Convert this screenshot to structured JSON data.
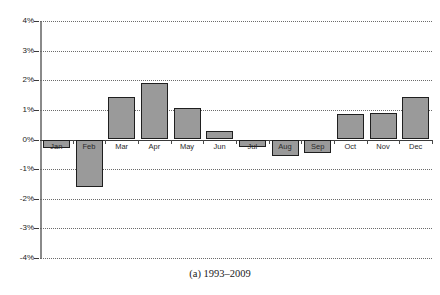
{
  "caption": "(a) 1993–2009",
  "chart_data": {
    "type": "bar",
    "title": "",
    "subtitle": "",
    "xlabel": "",
    "ylabel": "",
    "categories": [
      "Jan",
      "Feb",
      "Mar",
      "Apr",
      "May",
      "Jun",
      "Jul",
      "Aug",
      "Sep",
      "Oct",
      "Nov",
      "Dec"
    ],
    "values": [
      -0.28,
      -1.62,
      1.45,
      1.9,
      1.08,
      0.3,
      -0.25,
      -0.55,
      -0.45,
      0.85,
      0.9,
      1.45
    ],
    "ylim": [
      -4,
      4
    ],
    "ytick_values": [
      4,
      3,
      2,
      1,
      0,
      -1,
      -2,
      -3,
      -4
    ],
    "ytick_labels": [
      "4%",
      "3%",
      "2%",
      "1%",
      "0%",
      "-1%",
      "-2%",
      "-3%",
      "-4%"
    ],
    "grid": true,
    "grid_axis": "y",
    "grid_style": "dotted",
    "legend": null,
    "legend_position": "none",
    "bar_fill_color": "#9a9a9a",
    "bar_edge_color": "#1f1f1f",
    "axis_color": "#8a8a8a",
    "gridline_color": "#6b6b6b",
    "units": "percent"
  }
}
